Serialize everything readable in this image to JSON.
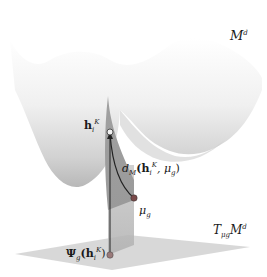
{
  "figure": {
    "manifold_label": {
      "main": "M",
      "sup": "d"
    },
    "tangent_label": {
      "main": "T",
      "sub": "μg",
      "rest": "M",
      "sup": "d"
    },
    "point_h_label": {
      "main": "h",
      "sub": "i",
      "sup": "K"
    },
    "distance_label": {
      "prefix": "d",
      "sub": "M",
      "open": "(h",
      "hsub": "i",
      "hsup": "K",
      "tail": ", μ",
      "tailsub": "g",
      "close": ")"
    },
    "mu_label": {
      "main": "μ",
      "sub": "g"
    },
    "psi_label": {
      "main": "Ψ",
      "sub": "g",
      "open": "(h",
      "hsub": "i",
      "hsup": "K",
      "close": ")"
    }
  },
  "colors": {
    "surface_light": "#f4f4f4",
    "surface_dark": "#bdbdbd",
    "spike": "#8a8a8a",
    "plane": "#cfcfcf",
    "projection_wall": "#b5b5b5",
    "point_mu": "#7a4a4a",
    "point_psi": "#9a7a7a",
    "line": "#222222"
  }
}
